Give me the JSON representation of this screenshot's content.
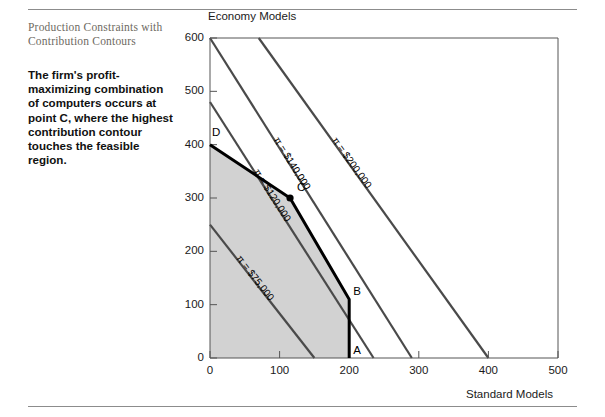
{
  "caption": {
    "title": "Production Constraints with Contribution Contours",
    "body": "The firm's profit-maximizing combination of computers occurs at point C, where the highest contribution contour touches the feasible region."
  },
  "chart_data": {
    "type": "line",
    "title": "",
    "xlabel": "Standard Models",
    "ylabel": "Economy Models",
    "xlim": [
      0,
      500
    ],
    "ylim": [
      0,
      600
    ],
    "xticks": [
      0,
      100,
      200,
      300,
      400,
      500
    ],
    "yticks": [
      0,
      100,
      200,
      300,
      400,
      500,
      600
    ],
    "xtick_labels": [
      "0",
      "100",
      "200",
      "300",
      "400",
      "500"
    ],
    "ytick_labels": [
      "0",
      "100",
      "200",
      "300",
      "400",
      "500",
      "600"
    ],
    "grid": false,
    "legend": "none",
    "colors": {
      "feasible_fill": "#d2d2d2",
      "contour_line": "#4a4a4a",
      "constraint_line": "#000000",
      "axis": "#555555"
    },
    "feasible_region": {
      "name": "feasible region",
      "vertices": [
        [
          0,
          0
        ],
        [
          0,
          400
        ],
        [
          115,
          300
        ],
        [
          200,
          110
        ],
        [
          200,
          0
        ]
      ]
    },
    "constraint_boundary": {
      "name": "feasible frontier",
      "points": [
        [
          0,
          400
        ],
        [
          115,
          300
        ],
        [
          200,
          110
        ],
        [
          200,
          0
        ]
      ]
    },
    "vertex_points": [
      {
        "label": "A",
        "x": 200,
        "y": 0
      },
      {
        "label": "B",
        "x": 200,
        "y": 110
      },
      {
        "label": "C",
        "x": 115,
        "y": 300
      },
      {
        "label": "D",
        "x": 0,
        "y": 400
      }
    ],
    "contours": [
      {
        "label": "π = $75,000",
        "value": 75000,
        "x_intercept": 150,
        "y_intercept": 250,
        "points": [
          [
            0,
            250
          ],
          [
            150,
            0
          ]
        ]
      },
      {
        "label": "π = $120,000",
        "value": 120000,
        "x_intercept": 235,
        "y_intercept": 480,
        "points": [
          [
            0,
            480
          ],
          [
            235,
            0
          ]
        ]
      },
      {
        "label": "π = $140,000",
        "value": 140000,
        "x_intercept": 290,
        "y_intercept": 600,
        "points": [
          [
            0,
            600
          ],
          [
            290,
            0
          ]
        ]
      },
      {
        "label": "π = $200,000",
        "value": 200000,
        "x_intercept": 400,
        "y_intercept": 600,
        "points": [
          [
            70,
            600
          ],
          [
            400,
            0
          ]
        ]
      }
    ]
  }
}
